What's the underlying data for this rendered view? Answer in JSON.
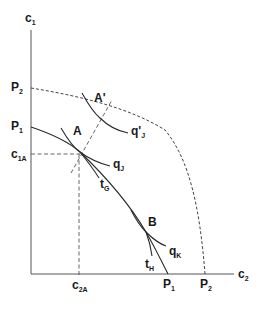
{
  "diagram": {
    "type": "production-possibility-frontier",
    "axes": {
      "y_label": {
        "main": "c",
        "sub": "1"
      },
      "x_label": {
        "main": "c",
        "sub": "2"
      }
    },
    "y_intercepts": [
      {
        "main": "P",
        "sub": "2"
      },
      {
        "main": "P",
        "sub": "1"
      }
    ],
    "x_intercepts": [
      {
        "main": "P",
        "sub": "1"
      },
      {
        "main": "P",
        "sub": "2"
      }
    ],
    "reference_lines": {
      "c1A": {
        "main": "c",
        "sub": "1A"
      },
      "c2A": {
        "main": "c",
        "sub": "2A"
      }
    },
    "points": {
      "A": "A",
      "A_prime": "A'",
      "B": "B"
    },
    "curves": {
      "qJ": {
        "main": "q",
        "sub": "J"
      },
      "qJ_prime": {
        "main": "q'",
        "sub": "J"
      },
      "qK": {
        "main": "q",
        "sub": "K"
      },
      "tG": {
        "main": "t",
        "sub": "G"
      },
      "tH": {
        "main": "t",
        "sub": "H"
      }
    },
    "colors": {
      "line": "#2a2a2a",
      "axis": "#555555",
      "background": "#ffffff"
    }
  }
}
